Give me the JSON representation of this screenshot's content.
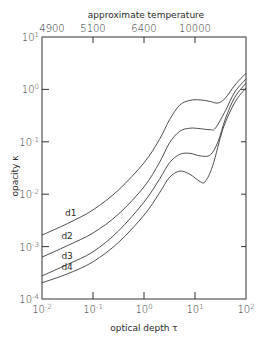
{
  "chart_data": {
    "type": "line",
    "title": "",
    "xlabel": "optical depth τ",
    "ylabel": "opacity κ",
    "top_axis_label": "approximate temperature",
    "xscale": "log",
    "yscale": "log",
    "xlim": [
      0.01,
      100
    ],
    "ylim": [
      0.0001,
      10
    ],
    "x_ticks": [
      {
        "base": "10",
        "exp": "-2",
        "value": 0.01
      },
      {
        "base": "10",
        "exp": "-1",
        "value": 0.1
      },
      {
        "base": "10",
        "exp": "0",
        "value": 1
      },
      {
        "base": "10",
        "exp": "1",
        "value": 10
      },
      {
        "base": "10",
        "exp": "2",
        "value": 100
      }
    ],
    "y_ticks": [
      {
        "base": "10",
        "exp": "1",
        "value": 10
      },
      {
        "base": "10",
        "exp": "0",
        "value": 1
      },
      {
        "base": "10",
        "exp": "-1",
        "value": 0.1
      },
      {
        "base": "10",
        "exp": "-2",
        "value": 0.01
      },
      {
        "base": "10",
        "exp": "-3",
        "value": 0.001
      },
      {
        "base": "10",
        "exp": "-4",
        "value": 0.0001
      }
    ],
    "top_ticks": [
      {
        "label": "4900",
        "tau": 0.01
      },
      {
        "label": "5100",
        "tau": 0.1
      },
      {
        "label": "6400",
        "tau": 1
      },
      {
        "label": "10000",
        "tau": 10
      }
    ],
    "grid": false,
    "legend": "inline labels",
    "series": [
      {
        "name": "d1",
        "log_tau": [
          -2.0,
          -1.5,
          -1.0,
          -0.5,
          0.0,
          0.3,
          0.5,
          0.7,
          0.9,
          1.1,
          1.3,
          1.45,
          1.6,
          1.78,
          2.0
        ],
        "log_kappa": [
          -2.78,
          -2.56,
          -2.3,
          -1.92,
          -1.4,
          -0.96,
          -0.58,
          -0.3,
          -0.21,
          -0.2,
          -0.23,
          -0.26,
          -0.16,
          0.08,
          0.31
        ]
      },
      {
        "name": "d2",
        "log_tau": [
          -2.0,
          -1.5,
          -1.0,
          -0.5,
          0.0,
          0.3,
          0.5,
          0.7,
          0.9,
          1.1,
          1.3,
          1.4,
          1.6,
          1.78,
          2.0
        ],
        "log_kappa": [
          -3.2,
          -2.98,
          -2.74,
          -2.38,
          -1.86,
          -1.4,
          -1.02,
          -0.8,
          -0.74,
          -0.75,
          -0.77,
          -0.74,
          -0.4,
          -0.05,
          0.2
        ]
      },
      {
        "name": "d3",
        "log_tau": [
          -2.0,
          -1.5,
          -1.0,
          -0.5,
          0.0,
          0.3,
          0.5,
          0.7,
          0.9,
          1.1,
          1.3,
          1.45,
          1.6,
          1.78,
          2.0
        ],
        "log_kappa": [
          -3.56,
          -3.34,
          -3.1,
          -2.7,
          -2.15,
          -1.72,
          -1.4,
          -1.24,
          -1.22,
          -1.27,
          -1.25,
          -1.0,
          -0.55,
          -0.15,
          0.12
        ]
      },
      {
        "name": "d4",
        "log_tau": [
          -2.0,
          -1.5,
          -1.0,
          -0.5,
          0.0,
          0.3,
          0.5,
          0.7,
          0.9,
          1.1,
          1.2,
          1.35,
          1.55,
          1.78,
          2.0
        ],
        "log_kappa": [
          -3.69,
          -3.52,
          -3.29,
          -2.92,
          -2.4,
          -1.98,
          -1.68,
          -1.56,
          -1.62,
          -1.76,
          -1.76,
          -1.45,
          -0.75,
          -0.25,
          0.03
        ]
      }
    ],
    "series_label_positions": [
      {
        "name": "d1",
        "log_tau": -1.55,
        "log_kappa": -2.42
      },
      {
        "name": "d2",
        "log_tau": -1.62,
        "log_kappa": -2.86
      },
      {
        "name": "d3",
        "log_tau": -1.62,
        "log_kappa": -3.24
      },
      {
        "name": "d4",
        "log_tau": -1.62,
        "log_kappa": -3.45
      }
    ]
  }
}
